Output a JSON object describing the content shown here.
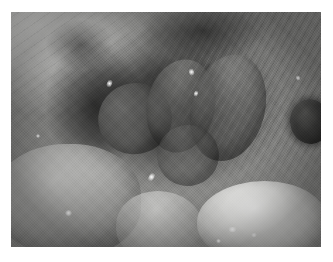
{
  "page": {
    "width": 333,
    "height": 262,
    "background_color": "#ffffff",
    "margin_color": "#ffffff"
  },
  "photograph": {
    "name": "intraoperative-surgical-photograph",
    "modality": "open surgical / endoscopic still photograph",
    "color_mode": "greyscale",
    "bounds": {
      "left": 11,
      "top": 12,
      "width": 310,
      "height": 235
    },
    "palette": {
      "lightest_tissue": "#fcfcfb",
      "light_fascia": "#cfcfcd",
      "mid_tissue": "#9a9a98",
      "shadow_tissue": "#5a5a58",
      "deep_cavity": "#262625",
      "darkest": "#1b1b1a"
    },
    "regions": [
      {
        "name": "fascia-upper-left",
        "label": "Pale fascial / fatty tissue sheet, upper-left quadrant",
        "tone": "light grey",
        "texture": "smooth with fine diagonal striations"
      },
      {
        "name": "fibrous-band-right",
        "label": "Striated fibrous tissue band, upper-right running diagonally",
        "tone": "mid grey",
        "texture": "strong parallel diagonal fibres"
      },
      {
        "name": "central-cavity",
        "label": "Deep shadowed surgical cavity, centre of field",
        "tone": "dark grey to near black",
        "texture": "shadowed recess"
      },
      {
        "name": "lobe-left",
        "label": "Rounded lobular tissue mass, left side of cavity",
        "tone": "mid-dark grey"
      },
      {
        "name": "lobe-center",
        "label": "Elongated lobular tissue mass, centre of cavity",
        "tone": "mid-dark grey"
      },
      {
        "name": "lobe-right",
        "label": "Elongated lobular tissue mass, right of cavity",
        "tone": "mid-dark grey"
      },
      {
        "name": "mass-lower-left",
        "label": "Pale rounded tissue mass, lower-left",
        "tone": "light grey"
      },
      {
        "name": "mass-bottom-center",
        "label": "Pale tissue fold, bottom centre",
        "tone": "light grey"
      },
      {
        "name": "mass-bright-right",
        "label": "Bright glistening rounded mass, bottom-right",
        "tone": "near white, wet specular surface"
      },
      {
        "name": "dark-oval-right",
        "label": "Dark oval structure at right margin",
        "tone": "near black"
      }
    ],
    "specular_highlights": [
      {
        "name": "specular-lower-left",
        "x_pct": 17.4,
        "y_pct": 84.3
      },
      {
        "name": "specular-bright-mass-1",
        "x_pct": 70.0,
        "y_pct": 91.5
      },
      {
        "name": "specular-bright-mass-2",
        "x_pct": 77.5,
        "y_pct": 94.0
      },
      {
        "name": "specular-bright-mass-3",
        "x_pct": 66.0,
        "y_pct": 96.5
      },
      {
        "name": "specular-cavity-left",
        "x_pct": 31.0,
        "y_pct": 28.5
      },
      {
        "name": "specular-cavity-top",
        "x_pct": 57.5,
        "y_pct": 24.0
      },
      {
        "name": "specular-cavity-right",
        "x_pct": 59.0,
        "y_pct": 33.0
      },
      {
        "name": "specular-cavity-low",
        "x_pct": 44.5,
        "y_pct": 68.0
      },
      {
        "name": "specular-right-margin",
        "x_pct": 92.0,
        "y_pct": 27.0
      },
      {
        "name": "specular-left-edge",
        "x_pct": 8.0,
        "y_pct": 52.0
      }
    ],
    "caption": "",
    "overlay_text": [],
    "annotations": []
  }
}
